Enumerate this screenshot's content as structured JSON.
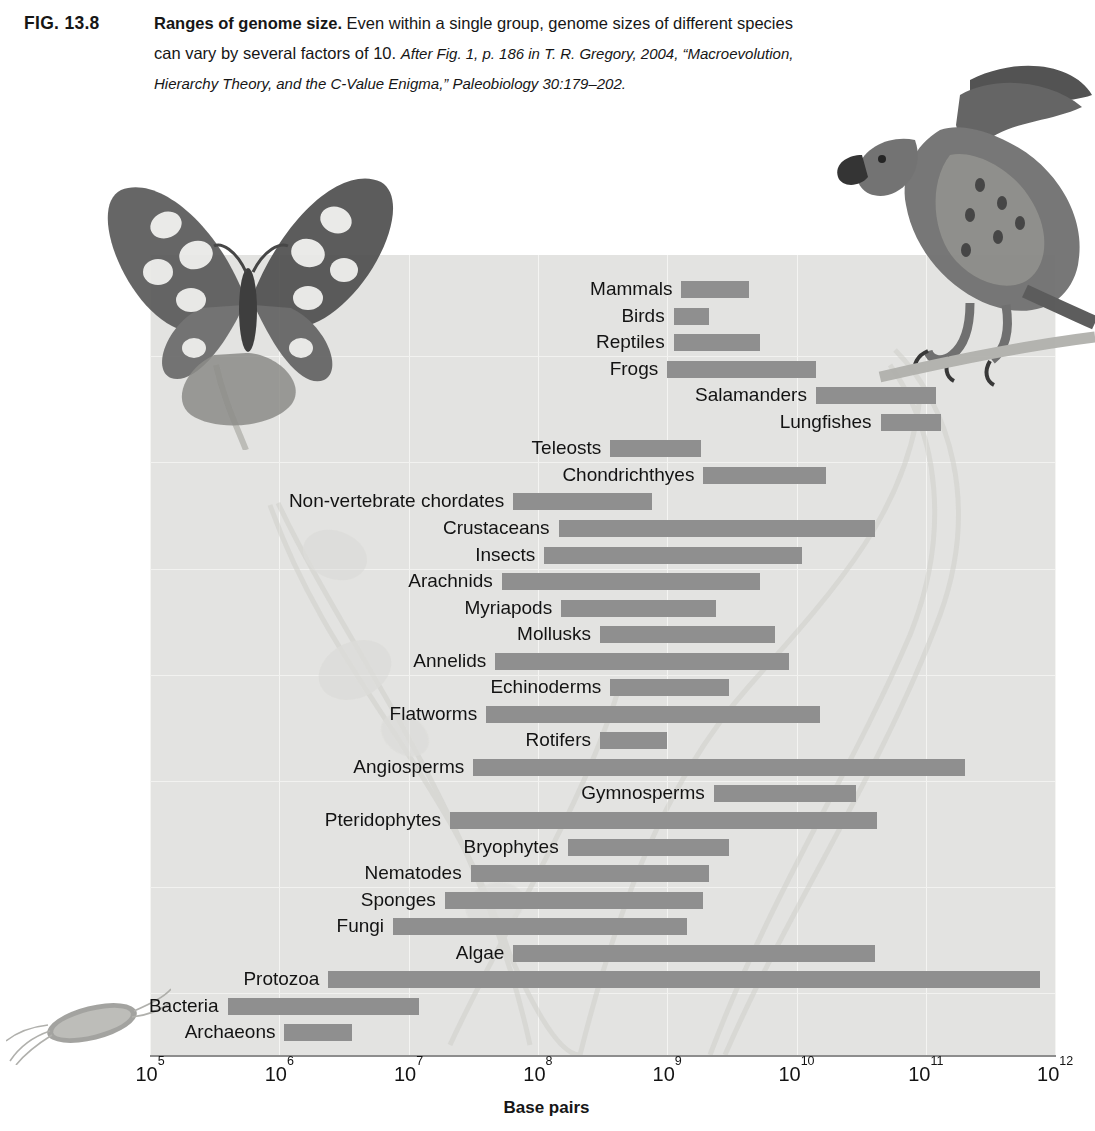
{
  "caption": {
    "figure_number": "FIG. 13.8",
    "title": "Ranges of genome size.",
    "body_line1": "Even within a single group, genome sizes of different species",
    "body_line2_plain": "can vary by several factors of 10.",
    "body_line2_italic": "After Fig. 1, p. 186 in T. R. Gregory, 2004, “Macroevolution,",
    "body_line3_italic": "Hierarchy Theory, and the C-Value Enigma,” Paleobiology 30:179–202."
  },
  "chart_data": {
    "type": "bar",
    "orientation": "horizontal",
    "title": "Ranges of genome size",
    "xlabel": "Base pairs",
    "ylabel": "",
    "xscale": "log",
    "xlim": [
      100000,
      1000000000000
    ],
    "grid": true,
    "legend": "none",
    "bar_color": "#8f8f8f",
    "plot_background": "#e3e3e1",
    "tick_labels": [
      "10⁵",
      "10⁶",
      "10⁷",
      "10⁸",
      "10⁹",
      "10¹⁰",
      "10¹¹",
      "10¹²"
    ],
    "tick_values": [
      100000,
      1000000,
      10000000,
      100000000,
      1000000000,
      10000000000,
      100000000000,
      1000000000000
    ],
    "categories": [
      "Mammals",
      "Birds",
      "Reptiles",
      "Frogs",
      "Salamanders",
      "Lungfishes",
      "Teleosts",
      "Chondrichthyes",
      "Non-vertebrate chordates",
      "Crustaceans",
      "Insects",
      "Arachnids",
      "Myriapods",
      "Mollusks",
      "Annelids",
      "Echinoderms",
      "Flatworms",
      "Rotifers",
      "Angiosperms",
      "Gymnosperms",
      "Pteridophytes",
      "Bryophytes",
      "Nematodes",
      "Sponges",
      "Fungi",
      "Algae",
      "Protozoa",
      "Bacteria",
      "Archaeons"
    ],
    "ranges": [
      {
        "label": "Mammals",
        "min": 1300000000.0,
        "max": 4300000000.0,
        "log_min": 9.11,
        "log_max": 9.63
      },
      {
        "label": "Birds",
        "min": 1100000000.0,
        "max": 2100000000.0,
        "log_min": 9.05,
        "log_max": 9.32
      },
      {
        "label": "Reptiles",
        "min": 1100000000.0,
        "max": 5200000000.0,
        "log_min": 9.05,
        "log_max": 9.72
      },
      {
        "label": "Frogs",
        "min": 1000000000.0,
        "max": 14000000000.0,
        "log_min": 9.0,
        "log_max": 10.15
      },
      {
        "label": "Salamanders",
        "min": 14000000000.0,
        "max": 120000000000.0,
        "log_min": 10.15,
        "log_max": 11.08
      },
      {
        "label": "Lungfishes",
        "min": 45000000000.0,
        "max": 130000000000.0,
        "log_min": 10.65,
        "log_max": 11.12
      },
      {
        "label": "Teleosts",
        "min": 360000000.0,
        "max": 1800000000.0,
        "log_min": 8.56,
        "log_max": 9.26
      },
      {
        "label": "Chondrichthyes",
        "min": 1900000000.0,
        "max": 17000000000.0,
        "log_min": 9.28,
        "log_max": 10.23
      },
      {
        "label": "Non-vertebrate chordates",
        "min": 65000000.0,
        "max": 750000000.0,
        "log_min": 7.81,
        "log_max": 8.88
      },
      {
        "label": "Crustaceans",
        "min": 140000000.0,
        "max": 41000000000.0,
        "log_min": 8.16,
        "log_max": 10.61
      },
      {
        "label": "Insects",
        "min": 110000000.0,
        "max": 11000000000.0,
        "log_min": 8.05,
        "log_max": 10.04
      },
      {
        "label": "Arachnids",
        "min": 50000000.0,
        "max": 5300000000.0,
        "log_min": 7.72,
        "log_max": 9.72
      },
      {
        "label": "Myriapods",
        "min": 150000000.0,
        "max": 2400000000.0,
        "log_min": 8.18,
        "log_max": 9.38
      },
      {
        "label": "Mollusks",
        "min": 300000000.0,
        "max": 6700000000.0,
        "log_min": 8.48,
        "log_max": 9.83
      },
      {
        "label": "Annelids",
        "min": 47000000.0,
        "max": 8800000000.0,
        "log_min": 7.67,
        "log_max": 9.94
      },
      {
        "label": "Echinoderms",
        "min": 360000000.0,
        "max": 3000000000.0,
        "log_min": 8.56,
        "log_max": 9.48
      },
      {
        "label": "Flatworms",
        "min": 40000000.0,
        "max": 15000000000.0,
        "log_min": 7.6,
        "log_max": 10.18
      },
      {
        "label": "Rotifers",
        "min": 300000000.0,
        "max": 1000000000.0,
        "log_min": 8.48,
        "log_max": 9.0
      },
      {
        "label": "Angiosperms",
        "min": 31000000.0,
        "max": 200000000000.0,
        "log_min": 7.5,
        "log_max": 11.3
      },
      {
        "label": "Gymnosperms",
        "min": 2300000000.0,
        "max": 29000000000.0,
        "log_min": 9.36,
        "log_max": 10.46
      },
      {
        "label": "Pteridophytes",
        "min": 21000000.0,
        "max": 42000000000.0,
        "log_min": 7.32,
        "log_max": 10.62
      },
      {
        "label": "Bryophytes",
        "min": 170000000.0,
        "max": 3000000000.0,
        "log_min": 8.23,
        "log_max": 9.48
      },
      {
        "label": "Nematodes",
        "min": 30000000.0,
        "max": 2100000000.0,
        "log_min": 7.48,
        "log_max": 9.32
      },
      {
        "label": "Sponges",
        "min": 19000000.0,
        "max": 1900000000.0,
        "log_min": 7.28,
        "log_max": 9.28
      },
      {
        "label": "Fungi",
        "min": 7500000.0,
        "max": 1400000000.0,
        "log_min": 6.88,
        "log_max": 9.15
      },
      {
        "label": "Algae",
        "min": 65000000.0,
        "max": 41000000000.0,
        "log_min": 7.81,
        "log_max": 10.61
      },
      {
        "label": "Protozoa",
        "min": 2400000.0,
        "max": 760000000000.0,
        "log_min": 6.38,
        "log_max": 11.88
      },
      {
        "label": "Bacteria",
        "min": 400000.0,
        "max": 12000000.0,
        "log_min": 5.6,
        "log_max": 7.08
      },
      {
        "label": "Archaeons",
        "min": 1100000.0,
        "max": 3600000.0,
        "log_min": 6.04,
        "log_max": 6.56
      }
    ]
  },
  "artwork": [
    {
      "name": "butterfly-illustration"
    },
    {
      "name": "hawk-illustration"
    },
    {
      "name": "bacteria-illustration"
    },
    {
      "name": "vine-illustration"
    }
  ]
}
